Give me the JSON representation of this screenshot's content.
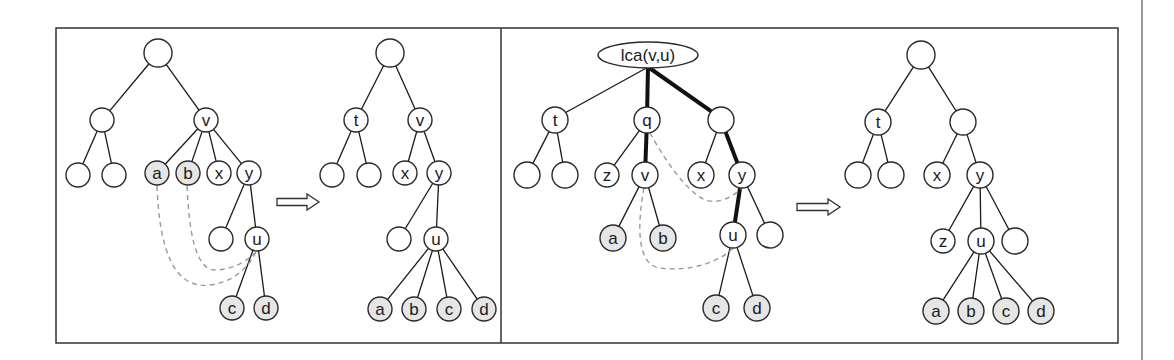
{
  "colors": {
    "node_fill": "#ffffff",
    "highlight_fill": "#e6e6e6",
    "stroke": "#2a2a2a",
    "dashed": "#9a9a9a"
  },
  "frame": {
    "x": 56,
    "y": 28,
    "width": 1062,
    "height": 315,
    "divider_x": 501
  },
  "page_line_x": 1142,
  "panels": [
    {
      "name": "panel-1-before",
      "nodes": [
        {
          "id": "r",
          "label": "",
          "x": 158,
          "y": 53,
          "r": 14
        },
        {
          "id": "n1",
          "label": "",
          "x": 102,
          "y": 120,
          "r": 12
        },
        {
          "id": "v",
          "label": "v",
          "x": 206,
          "y": 120,
          "r": 12
        },
        {
          "id": "l1",
          "label": "",
          "x": 78,
          "y": 175,
          "r": 12
        },
        {
          "id": "l2",
          "label": "",
          "x": 114,
          "y": 175,
          "r": 12
        },
        {
          "id": "a",
          "label": "a",
          "x": 157,
          "y": 173,
          "r": 12,
          "highlight": true
        },
        {
          "id": "b",
          "label": "b",
          "x": 188,
          "y": 173,
          "r": 12,
          "highlight": true
        },
        {
          "id": "x",
          "label": "x",
          "x": 219,
          "y": 173,
          "r": 12
        },
        {
          "id": "y",
          "label": "y",
          "x": 249,
          "y": 173,
          "r": 12
        },
        {
          "id": "e1",
          "label": "",
          "x": 221,
          "y": 239,
          "r": 12
        },
        {
          "id": "u",
          "label": "u",
          "x": 257,
          "y": 239,
          "r": 12
        },
        {
          "id": "c",
          "label": "c",
          "x": 232,
          "y": 308,
          "r": 12,
          "highlight": true
        },
        {
          "id": "d",
          "label": "d",
          "x": 266,
          "y": 308,
          "r": 12,
          "highlight": true
        }
      ],
      "edges": [
        [
          "r",
          "n1"
        ],
        [
          "r",
          "v"
        ],
        [
          "n1",
          "l1"
        ],
        [
          "n1",
          "l2"
        ],
        [
          "v",
          "a"
        ],
        [
          "v",
          "b"
        ],
        [
          "v",
          "x"
        ],
        [
          "v",
          "y"
        ],
        [
          "y",
          "e1"
        ],
        [
          "y",
          "u"
        ],
        [
          "u",
          "c"
        ],
        [
          "u",
          "d"
        ]
      ],
      "bold_edges": [],
      "dashed": [
        "M157,186 C159,240 170,290 210,285 C235,282 250,265 256,252",
        "M187,186 C189,230 195,270 215,270 C235,270 250,258 256,252"
      ]
    },
    {
      "name": "panel-2-after",
      "nodes": [
        {
          "id": "r",
          "label": "",
          "x": 390,
          "y": 53,
          "r": 14
        },
        {
          "id": "t",
          "label": "t",
          "x": 356,
          "y": 120,
          "r": 12
        },
        {
          "id": "v",
          "label": "v",
          "x": 420,
          "y": 120,
          "r": 12
        },
        {
          "id": "l1",
          "label": "",
          "x": 332,
          "y": 175,
          "r": 12
        },
        {
          "id": "l2",
          "label": "",
          "x": 369,
          "y": 175,
          "r": 12
        },
        {
          "id": "x",
          "label": "x",
          "x": 405,
          "y": 173,
          "r": 12
        },
        {
          "id": "y",
          "label": "y",
          "x": 439,
          "y": 173,
          "r": 12
        },
        {
          "id": "e1",
          "label": "",
          "x": 399,
          "y": 239,
          "r": 12
        },
        {
          "id": "u",
          "label": "u",
          "x": 436,
          "y": 239,
          "r": 12
        },
        {
          "id": "a",
          "label": "a",
          "x": 380,
          "y": 309,
          "r": 12,
          "highlight": true
        },
        {
          "id": "b",
          "label": "b",
          "x": 414,
          "y": 309,
          "r": 12,
          "highlight": true
        },
        {
          "id": "c",
          "label": "c",
          "x": 449,
          "y": 309,
          "r": 12,
          "highlight": true
        },
        {
          "id": "d",
          "label": "d",
          "x": 484,
          "y": 309,
          "r": 12,
          "highlight": true
        }
      ],
      "edges": [
        [
          "r",
          "t"
        ],
        [
          "r",
          "v"
        ],
        [
          "t",
          "l1"
        ],
        [
          "t",
          "l2"
        ],
        [
          "v",
          "x"
        ],
        [
          "v",
          "y"
        ],
        [
          "y",
          "e1"
        ],
        [
          "y",
          "u"
        ],
        [
          "u",
          "a"
        ],
        [
          "u",
          "b"
        ],
        [
          "u",
          "c"
        ],
        [
          "u",
          "d"
        ]
      ],
      "bold_edges": [],
      "dashed": []
    },
    {
      "name": "panel-3-before",
      "nodes": [
        {
          "id": "lca",
          "label": "lca(v,u)",
          "x": 648,
          "y": 55,
          "rx": 50,
          "ry": 13,
          "ellipse": true
        },
        {
          "id": "t",
          "label": "t",
          "x": 555,
          "y": 120,
          "r": 13
        },
        {
          "id": "q",
          "label": "q",
          "x": 647,
          "y": 120,
          "r": 13
        },
        {
          "id": "m",
          "label": "",
          "x": 721,
          "y": 120,
          "r": 13
        },
        {
          "id": "l1",
          "label": "",
          "x": 527,
          "y": 175,
          "r": 13
        },
        {
          "id": "l2",
          "label": "",
          "x": 565,
          "y": 175,
          "r": 13
        },
        {
          "id": "z",
          "label": "z",
          "x": 607,
          "y": 175,
          "r": 12
        },
        {
          "id": "v",
          "label": "v",
          "x": 645,
          "y": 175,
          "r": 13
        },
        {
          "id": "x",
          "label": "x",
          "x": 701,
          "y": 175,
          "r": 13
        },
        {
          "id": "y",
          "label": "y",
          "x": 742,
          "y": 175,
          "r": 13
        },
        {
          "id": "a",
          "label": "a",
          "x": 613,
          "y": 238,
          "r": 13,
          "highlight": true
        },
        {
          "id": "b",
          "label": "b",
          "x": 663,
          "y": 238,
          "r": 13,
          "highlight": true
        },
        {
          "id": "u",
          "label": "u",
          "x": 733,
          "y": 235,
          "r": 13
        },
        {
          "id": "e1",
          "label": "",
          "x": 770,
          "y": 235,
          "r": 13
        },
        {
          "id": "c",
          "label": "c",
          "x": 716,
          "y": 308,
          "r": 13,
          "highlight": true
        },
        {
          "id": "d",
          "label": "d",
          "x": 757,
          "y": 308,
          "r": 13,
          "highlight": true
        }
      ],
      "edges": [
        [
          "lca",
          "t"
        ],
        [
          "t",
          "l1"
        ],
        [
          "t",
          "l2"
        ],
        [
          "q",
          "z"
        ],
        [
          "m",
          "x"
        ],
        [
          "v",
          "a"
        ],
        [
          "v",
          "b"
        ],
        [
          "y",
          "e1"
        ],
        [
          "u",
          "c"
        ],
        [
          "u",
          "d"
        ]
      ],
      "bold_edges": [
        [
          "lca",
          "q"
        ],
        [
          "lca",
          "m"
        ],
        [
          "q",
          "v"
        ],
        [
          "m",
          "y"
        ],
        [
          "y",
          "u"
        ]
      ],
      "dashed": [
        "M650,133 C665,160 685,190 705,200 C720,205 735,195 742,188",
        "M644,188 C638,220 635,265 660,268 C690,272 720,262 733,248"
      ]
    },
    {
      "name": "panel-4-after",
      "nodes": [
        {
          "id": "r",
          "label": "",
          "x": 921,
          "y": 55,
          "r": 14
        },
        {
          "id": "t",
          "label": "t",
          "x": 878,
          "y": 122,
          "r": 13
        },
        {
          "id": "m",
          "label": "",
          "x": 963,
          "y": 122,
          "r": 13
        },
        {
          "id": "l1",
          "label": "",
          "x": 858,
          "y": 175,
          "r": 13
        },
        {
          "id": "l2",
          "label": "",
          "x": 891,
          "y": 175,
          "r": 13
        },
        {
          "id": "x",
          "label": "x",
          "x": 937,
          "y": 175,
          "r": 13
        },
        {
          "id": "y",
          "label": "y",
          "x": 980,
          "y": 175,
          "r": 13
        },
        {
          "id": "z",
          "label": "z",
          "x": 943,
          "y": 241,
          "r": 12
        },
        {
          "id": "u",
          "label": "u",
          "x": 981,
          "y": 241,
          "r": 13
        },
        {
          "id": "e1",
          "label": "",
          "x": 1015,
          "y": 241,
          "r": 13
        },
        {
          "id": "a",
          "label": "a",
          "x": 936,
          "y": 311,
          "r": 13,
          "highlight": true
        },
        {
          "id": "b",
          "label": "b",
          "x": 971,
          "y": 311,
          "r": 13,
          "highlight": true
        },
        {
          "id": "c",
          "label": "c",
          "x": 1006,
          "y": 311,
          "r": 13,
          "highlight": true
        },
        {
          "id": "d",
          "label": "d",
          "x": 1041,
          "y": 311,
          "r": 13,
          "highlight": true
        }
      ],
      "edges": [
        [
          "r",
          "t"
        ],
        [
          "r",
          "m"
        ],
        [
          "t",
          "l1"
        ],
        [
          "t",
          "l2"
        ],
        [
          "m",
          "x"
        ],
        [
          "m",
          "y"
        ],
        [
          "y",
          "z"
        ],
        [
          "y",
          "u"
        ],
        [
          "y",
          "e1"
        ],
        [
          "u",
          "a"
        ],
        [
          "u",
          "b"
        ],
        [
          "u",
          "c"
        ],
        [
          "u",
          "d"
        ]
      ],
      "bold_edges": [],
      "dashed": []
    }
  ],
  "arrows": [
    {
      "name": "transform-arrow-1",
      "x": 277,
      "y": 202,
      "length": 42
    },
    {
      "name": "transform-arrow-2",
      "x": 797,
      "y": 207,
      "length": 43
    }
  ]
}
